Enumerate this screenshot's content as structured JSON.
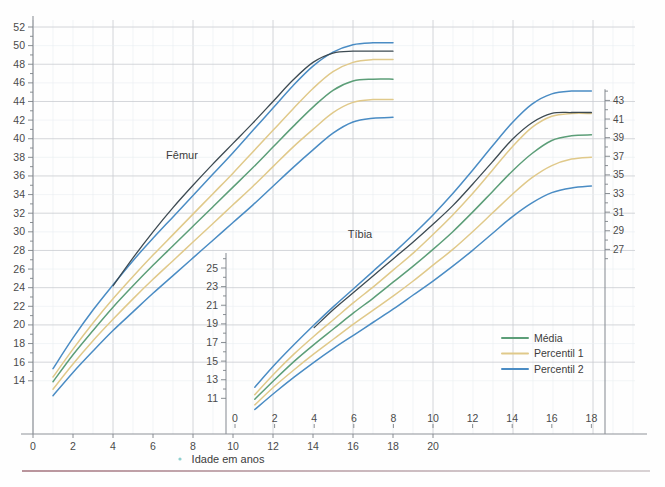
{
  "figure": {
    "xlabel": "Idade em anos",
    "panel_labels": {
      "femur": "Fêmur",
      "tibia": "Tíbia"
    }
  },
  "colors": {
    "media": "#5c9e78",
    "percentil1": "#e0c98a",
    "percentil2": "#4a8cc4",
    "patient": "#3d4a52",
    "grid_major": "#c9ccd1",
    "grid_minor": "#e9eef2",
    "axis": "#8d9298",
    "text": "#3c3c3c"
  },
  "legend": {
    "position": "bottom-right",
    "items": [
      {
        "label": "Média",
        "color": "#5c9e78"
      },
      {
        "label": "Percentil 1",
        "color": "#e0c98a"
      },
      {
        "label": "Percentil 2",
        "color": "#4a8cc4"
      }
    ]
  },
  "axes": {
    "left": {
      "name": "femur-length-cm",
      "ticks": [
        14,
        16,
        18,
        20,
        22,
        24,
        26,
        28,
        30,
        32,
        34,
        36,
        38,
        40,
        42,
        44,
        46,
        48,
        50,
        52
      ],
      "range": [
        12.5,
        53
      ]
    },
    "middle": {
      "name": "tibia-length-cm",
      "ticks": [
        11,
        13,
        15,
        17,
        19,
        21,
        23,
        25
      ],
      "range": [
        10,
        26.5
      ]
    },
    "right": {
      "name": "tibia-length-cm-upper",
      "ticks": [
        27,
        29,
        31,
        33,
        35,
        37,
        39,
        41,
        43
      ],
      "range": [
        25.5,
        44.5
      ]
    },
    "x_bottom": {
      "name": "age-years-femur",
      "ticks": [
        0,
        2,
        4,
        6,
        8,
        10,
        12,
        14,
        16,
        18,
        20
      ],
      "range": [
        0,
        21.5
      ]
    },
    "x_top": {
      "name": "age-years-tibia",
      "ticks": [
        0,
        2,
        4,
        6,
        8,
        10,
        12,
        14,
        16,
        18
      ],
      "range": [
        0,
        19.5
      ]
    }
  },
  "chart_data": {
    "type": "line",
    "title": "",
    "subtitle": "",
    "xlabel": "Idade em anos",
    "ylabel": "Comprimento (cm)",
    "grid": true,
    "legend_position": "bottom-right",
    "panels": [
      {
        "name": "femur",
        "label": "Fêmur",
        "xlabel": "Idade em anos",
        "ylabel": "Comprimento do fêmur (cm)",
        "xlim": [
          0,
          21.5
        ],
        "ylim": [
          12.5,
          53
        ],
        "x": [
          1,
          2,
          3,
          4,
          5,
          6,
          7,
          8,
          9,
          10,
          11,
          12,
          13,
          14,
          15,
          16,
          17,
          18
        ],
        "series": [
          {
            "name": "Percentil 2 superior",
            "color": "#4a8cc4",
            "values": [
              15.3,
              18.6,
              21.6,
              24.3,
              26.9,
              29.3,
              31.6,
              33.9,
              36.2,
              38.5,
              40.9,
              43.3,
              45.7,
              47.8,
              49.3,
              50.1,
              50.3,
              50.3
            ]
          },
          {
            "name": "Percentil 1 superior",
            "color": "#e0c98a",
            "values": [
              14.4,
              17.4,
              20.2,
              22.8,
              25.2,
              27.5,
              29.7,
              31.9,
              34.1,
              36.3,
              38.6,
              40.9,
              43.2,
              45.4,
              47.2,
              48.2,
              48.5,
              48.5
            ]
          },
          {
            "name": "Média",
            "color": "#5c9e78",
            "values": [
              13.9,
              16.8,
              19.4,
              21.9,
              24.2,
              26.4,
              28.5,
              30.6,
              32.7,
              34.8,
              36.9,
              39.1,
              41.3,
              43.4,
              45.2,
              46.2,
              46.4,
              46.4
            ]
          },
          {
            "name": "Percentil 1 inferior",
            "color": "#e0c98a",
            "values": [
              13.1,
              15.8,
              18.3,
              20.6,
              22.8,
              24.9,
              26.9,
              28.9,
              30.9,
              32.9,
              34.9,
              37.0,
              39.1,
              41.0,
              42.8,
              43.9,
              44.2,
              44.2
            ]
          },
          {
            "name": "Percentil 2 inferior",
            "color": "#4a8cc4",
            "values": [
              12.4,
              14.9,
              17.2,
              19.4,
              21.4,
              23.4,
              25.3,
              27.2,
              29.1,
              31.0,
              32.9,
              34.9,
              36.9,
              38.8,
              40.6,
              41.8,
              42.2,
              42.3
            ]
          },
          {
            "name": "Trajetória do paciente",
            "color": "#3d4a52",
            "values": [
              null,
              null,
              null,
              24.2,
              27.2,
              30.0,
              32.6,
              35.0,
              37.3,
              39.5,
              41.7,
              44.0,
              46.3,
              48.2,
              49.2,
              49.4,
              49.4,
              49.4
            ]
          }
        ]
      },
      {
        "name": "tibia",
        "label": "Tíbia",
        "xlabel": "Idade em anos",
        "ylabel": "Comprimento da tíbia (cm)",
        "xlim": [
          0,
          19.5
        ],
        "ylim": [
          10,
          44.5
        ],
        "x": [
          1,
          2,
          3,
          4,
          5,
          6,
          7,
          8,
          9,
          10,
          11,
          12,
          13,
          14,
          15,
          16,
          17,
          18
        ],
        "series": [
          {
            "name": "Percentil 2 superior",
            "color": "#4a8cc4",
            "values": [
              12.2,
              14.6,
              16.8,
              18.9,
              20.9,
              22.8,
              24.7,
              26.6,
              28.6,
              30.7,
              33.0,
              35.5,
              38.1,
              40.6,
              42.6,
              43.7,
              44.0,
              44.0
            ]
          },
          {
            "name": "Percentil 1 superior",
            "color": "#e0c98a",
            "values": [
              11.4,
              13.7,
              15.8,
              17.7,
              19.5,
              21.3,
              23.0,
              24.8,
              26.6,
              28.6,
              30.7,
              33.0,
              35.5,
              38.0,
              40.1,
              41.3,
              41.6,
              41.6
            ]
          },
          {
            "name": "Média",
            "color": "#5c9e78",
            "values": [
              10.9,
              13.0,
              15.0,
              16.8,
              18.5,
              20.2,
              21.8,
              23.5,
              25.2,
              27.0,
              28.9,
              31.0,
              33.2,
              35.4,
              37.3,
              38.7,
              39.2,
              39.3
            ]
          },
          {
            "name": "Percentil 1 inferior",
            "color": "#e0c98a",
            "values": [
              10.3,
              12.3,
              14.1,
              15.8,
              17.4,
              19.0,
              20.5,
              22.0,
              23.6,
              25.3,
              27.0,
              28.9,
              30.9,
              32.9,
              34.7,
              36.0,
              36.7,
              36.9
            ]
          },
          {
            "name": "Percentil 2 inferior",
            "color": "#4a8cc4",
            "values": [
              9.8,
              11.6,
              13.3,
              14.9,
              16.4,
              17.8,
              19.2,
              20.6,
              22.1,
              23.6,
              25.2,
              26.9,
              28.7,
              30.5,
              32.0,
              33.1,
              33.6,
              33.8
            ]
          },
          {
            "name": "Trajetória do paciente",
            "color": "#3d4a52",
            "values": [
              null,
              null,
              null,
              18.6,
              20.6,
              22.4,
              24.2,
              26.0,
              27.8,
              29.7,
              31.7,
              34.0,
              36.4,
              38.8,
              40.6,
              41.6,
              41.7,
              41.7
            ]
          }
        ]
      }
    ]
  }
}
